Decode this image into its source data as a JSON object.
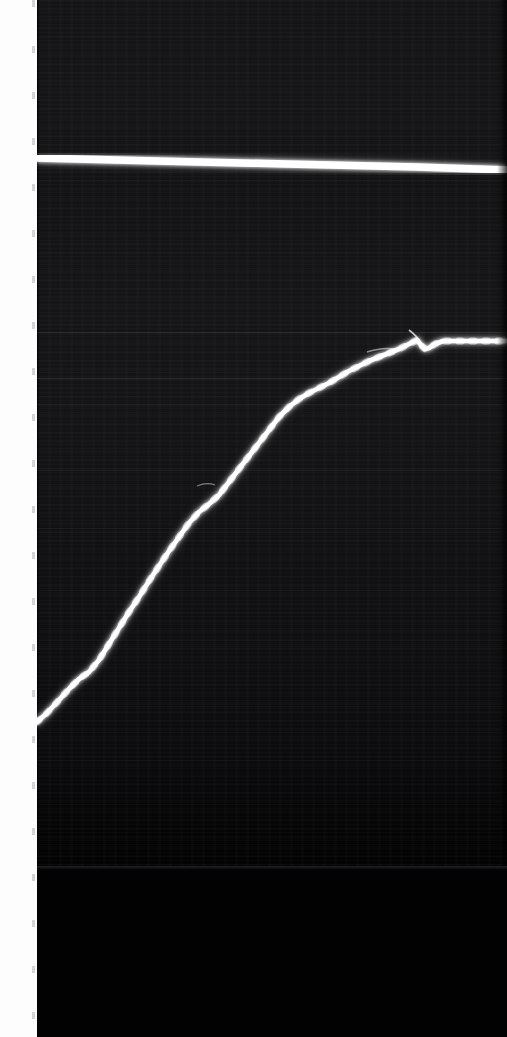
{
  "page": {
    "width": 507,
    "height": 1037,
    "background_color": "#ffffff"
  },
  "margin": {
    "copyright_notice": "Copyright © 1987 by Houghton Mifflin Company. All rights reserved. Printed in U.S.A.",
    "text_color": "#16161a",
    "strip_color": "#fdfdfd",
    "orientation": "rotated-90-ccw"
  },
  "plate": {
    "description": "dark photographic / oscilloscope plate",
    "background_color": "#141416",
    "trace_color": "#ffffff",
    "left": 37,
    "top": 0,
    "width": 470,
    "height": 872
  },
  "chart_data": {
    "type": "line",
    "title": "",
    "subtitle": "",
    "xlabel": "",
    "ylabel": "",
    "grid": false,
    "legend": "none",
    "xlim": [
      0,
      470
    ],
    "ylim": [
      872,
      0
    ],
    "background": "#141416",
    "series": [
      {
        "name": "sigmoid-trace",
        "color": "#ffffff",
        "description": "bright S-shaped rising curve with ragged edge, plateauing at upper right",
        "points": [
          [
            0,
            722
          ],
          [
            10,
            713
          ],
          [
            22,
            700
          ],
          [
            32,
            689
          ],
          [
            42,
            679
          ],
          [
            52,
            672
          ],
          [
            62,
            660
          ],
          [
            72,
            644
          ],
          [
            82,
            628
          ],
          [
            92,
            612
          ],
          [
            102,
            597
          ],
          [
            112,
            581
          ],
          [
            122,
            566
          ],
          [
            132,
            551
          ],
          [
            142,
            537
          ],
          [
            152,
            523
          ],
          [
            162,
            512
          ],
          [
            172,
            504
          ],
          [
            182,
            495
          ],
          [
            192,
            482
          ],
          [
            202,
            469
          ],
          [
            212,
            456
          ],
          [
            222,
            443
          ],
          [
            232,
            430
          ],
          [
            242,
            417
          ],
          [
            252,
            407
          ],
          [
            262,
            399
          ],
          [
            272,
            393
          ],
          [
            282,
            388
          ],
          [
            292,
            383
          ],
          [
            302,
            377
          ],
          [
            312,
            371
          ],
          [
            322,
            366
          ],
          [
            332,
            361
          ],
          [
            342,
            357
          ],
          [
            352,
            353
          ],
          [
            362,
            349
          ],
          [
            370,
            345
          ],
          [
            376,
            342
          ],
          [
            380,
            340
          ],
          [
            384,
            345
          ],
          [
            388,
            349
          ],
          [
            392,
            348
          ],
          [
            398,
            344
          ],
          [
            406,
            341
          ],
          [
            420,
            341
          ],
          [
            450,
            341
          ],
          [
            470,
            341
          ]
        ]
      },
      {
        "name": "top-horizontal-trace",
        "color": "#ffffff",
        "description": "bright nearly-horizontal band near top of plate, slight downward slope left-to-right",
        "points": [
          [
            0,
            158
          ],
          [
            120,
            161
          ],
          [
            250,
            164
          ],
          [
            380,
            167
          ],
          [
            470,
            170
          ]
        ]
      }
    ],
    "guide_lines_y": [
      332,
      378,
      404,
      470,
      528,
      590,
      646,
      706,
      760
    ],
    "annotations": []
  }
}
